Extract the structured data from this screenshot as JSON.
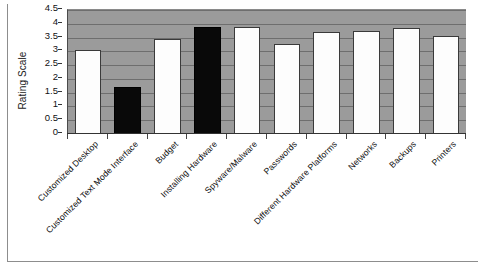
{
  "figure": {
    "title_remnant": "",
    "background_color": "#ffffff",
    "plot_background_color": "#9b9b9b",
    "gridline_color": "#6e6e6e",
    "bar_fill_default": "#fdfdfd",
    "bar_fill_highlight": "#090909",
    "bar_border_color": "#3a3a3a"
  },
  "chart_data": {
    "type": "bar",
    "title": "",
    "xlabel": "",
    "ylabel": "Rating Scale",
    "ylim": [
      0,
      4.5
    ],
    "ytick_step": 0.5,
    "grid": true,
    "legend": false,
    "orientation": "vertical",
    "categories": [
      "Customized Desktop",
      "Customized Text Mode Interface",
      "Budget",
      "Installing Hardware",
      "Spyware/Malware",
      "Passwords",
      "Different Hardware Platforms",
      "Networks",
      "Backups",
      "Printers"
    ],
    "values": [
      3.05,
      1.7,
      3.45,
      3.9,
      3.9,
      3.25,
      3.7,
      3.75,
      3.85,
      3.55
    ],
    "bar_colors": [
      "white",
      "black",
      "white",
      "black",
      "white",
      "white",
      "white",
      "white",
      "white",
      "white"
    ],
    "ytick_labels": [
      "0",
      "0.5",
      "1",
      "1.5",
      "2",
      "2.5",
      "3",
      "3.5",
      "4",
      "4.5"
    ],
    "ytick_values": [
      0,
      0.5,
      1,
      1.5,
      2,
      2.5,
      3,
      3.5,
      4,
      4.5
    ]
  }
}
